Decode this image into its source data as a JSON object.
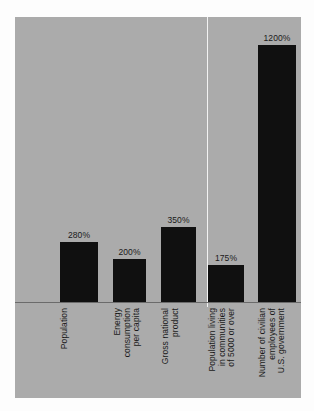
{
  "chart_data": {
    "type": "bar",
    "title": "",
    "subtitle": "",
    "xlabel": "",
    "ylabel": "",
    "grid": false,
    "legend": false,
    "ylim": [
      0,
      1330
    ],
    "categories": [
      "Population",
      "Energy consumption per capita",
      "Gross national product",
      "Population living in communities of 5000 or over",
      "Number of civilian employees of U.S. government"
    ],
    "category_lines": [
      [
        "Population"
      ],
      [
        "Energy",
        "consumption",
        "per capita"
      ],
      [
        "Gross national",
        "product"
      ],
      [
        "Population living",
        "in communities",
        "of 5000 or over"
      ],
      [
        "Number of civilian",
        "employees of",
        "U.S. government"
      ]
    ],
    "values": [
      280,
      200,
      350,
      175,
      1200
    ],
    "value_labels": [
      "280%",
      "200%",
      "350%",
      "175%",
      "1200%"
    ],
    "units": "%",
    "bar_color": "#101010",
    "background_color": "#ababab",
    "axis_color": "#6b6b6b",
    "divider_color": "#f2f2f2",
    "annotations": [
      {
        "name": "vertical-divider",
        "description": "white vertical rule between category 3 and category 4"
      }
    ]
  }
}
